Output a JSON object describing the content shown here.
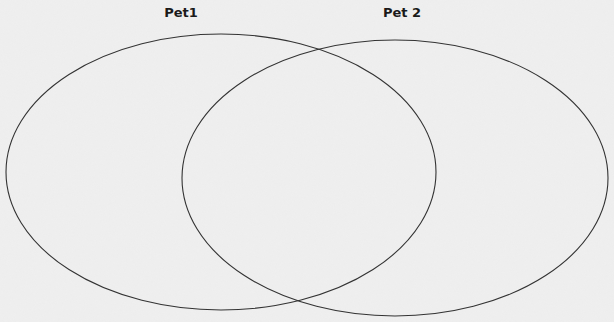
{
  "diagram": {
    "type": "venn",
    "sets": [
      {
        "label": "Pet1",
        "ellipse": {
          "cx": 221,
          "cy": 172,
          "rx": 215,
          "ry": 138
        }
      },
      {
        "label": "Pet 2",
        "ellipse": {
          "cx": 395,
          "cy": 178,
          "rx": 213,
          "ry": 138
        }
      }
    ],
    "stroke_color": "#333333",
    "background_color": "#ededed"
  }
}
